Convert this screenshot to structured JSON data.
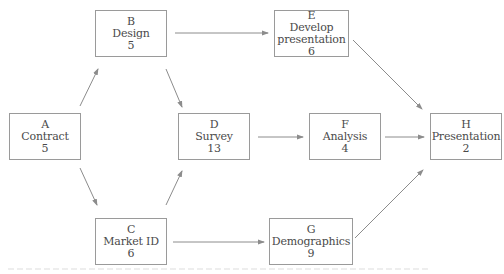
{
  "diagram": {
    "type": "activity-network",
    "colors": {
      "box_border": "#9a9a9a",
      "text": "#4a4a4a",
      "arrow": "#8c8c8c",
      "background": "#ffffff"
    },
    "nodes": [
      {
        "id": "A",
        "letter": "A",
        "name": "Contract",
        "duration": "5",
        "x": 9,
        "y": 113,
        "w": 72,
        "h": 47
      },
      {
        "id": "B",
        "letter": "B",
        "name": "Design",
        "duration": "5",
        "x": 95,
        "y": 10,
        "w": 72,
        "h": 47
      },
      {
        "id": "C",
        "letter": "C",
        "name": "Market ID",
        "duration": "6",
        "x": 95,
        "y": 218,
        "w": 72,
        "h": 47
      },
      {
        "id": "D",
        "letter": "D",
        "name": "Survey",
        "duration": "13",
        "x": 178,
        "y": 113,
        "w": 72,
        "h": 47
      },
      {
        "id": "E",
        "letter": "E",
        "name": "Develop presentation",
        "name_lines": [
          "Develop",
          "presentation"
        ],
        "duration": "6",
        "x": 274,
        "y": 10,
        "w": 75,
        "h": 47
      },
      {
        "id": "F",
        "letter": "F",
        "name": "Analysis",
        "duration": "4",
        "x": 309,
        "y": 113,
        "w": 72,
        "h": 47
      },
      {
        "id": "G",
        "letter": "G",
        "name": "Demographics",
        "duration": "9",
        "x": 269,
        "y": 218,
        "w": 84,
        "h": 47
      },
      {
        "id": "H",
        "letter": "H",
        "name": "Presentation",
        "duration": "2",
        "x": 430,
        "y": 113,
        "w": 72,
        "h": 47
      }
    ],
    "edges": [
      {
        "from": "A",
        "to": "B",
        "x1": 80,
        "y1": 106,
        "x2": 98,
        "y2": 69
      },
      {
        "from": "A",
        "to": "C",
        "x1": 80,
        "y1": 168,
        "x2": 97,
        "y2": 205
      },
      {
        "from": "B",
        "to": "D",
        "x1": 166,
        "y1": 69,
        "x2": 182,
        "y2": 107
      },
      {
        "from": "C",
        "to": "D",
        "x1": 166,
        "y1": 205,
        "x2": 182,
        "y2": 171
      },
      {
        "from": "B",
        "to": "E",
        "x1": 175,
        "y1": 33,
        "x2": 268,
        "y2": 33
      },
      {
        "from": "D",
        "to": "F",
        "x1": 258,
        "y1": 137,
        "x2": 303,
        "y2": 137
      },
      {
        "from": "C",
        "to": "G",
        "x1": 173,
        "y1": 242,
        "x2": 264,
        "y2": 242
      },
      {
        "from": "E",
        "to": "H",
        "x1": 353,
        "y1": 40,
        "x2": 422,
        "y2": 109
      },
      {
        "from": "F",
        "to": "H",
        "x1": 385,
        "y1": 137,
        "x2": 424,
        "y2": 137
      },
      {
        "from": "G",
        "to": "H",
        "x1": 355,
        "y1": 238,
        "x2": 423,
        "y2": 170
      }
    ]
  }
}
